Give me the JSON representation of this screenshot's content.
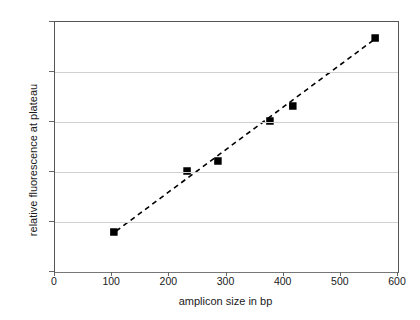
{
  "chart_data": {
    "type": "scatter",
    "title": "",
    "xlabel": "amplicon size in bp",
    "ylabel": "relative fluorescence at plateau",
    "xlim": [
      0,
      600
    ],
    "ylim": [
      1,
      3.5
    ],
    "xticks": [
      0,
      100,
      200,
      300,
      400,
      500,
      600
    ],
    "yticks": [
      1,
      1.5,
      2,
      2.5,
      3,
      3.5
    ],
    "xtick_labels": [
      "0",
      "100",
      "200",
      "300",
      "400",
      "500",
      "600"
    ],
    "ytick_labels": [
      "1",
      "1.5",
      "2",
      "2.5",
      "3",
      "3.5"
    ],
    "grid": "horizontal",
    "legend": "none",
    "marker": "filled-square",
    "marker_color": "#000000",
    "series": [
      {
        "name": "relative fluorescence at plateau",
        "points": [
          {
            "x": 103,
            "y": 1.4
          },
          {
            "x": 231,
            "y": 2.01
          },
          {
            "x": 285,
            "y": 2.11
          },
          {
            "x": 376,
            "y": 2.51
          },
          {
            "x": 416,
            "y": 2.66
          },
          {
            "x": 560,
            "y": 3.34
          }
        ]
      }
    ],
    "trendline": {
      "style": "dashed",
      "color": "#000000",
      "x_start": 107,
      "y_start": 1.41,
      "x_end": 562,
      "y_end": 3.34
    }
  }
}
